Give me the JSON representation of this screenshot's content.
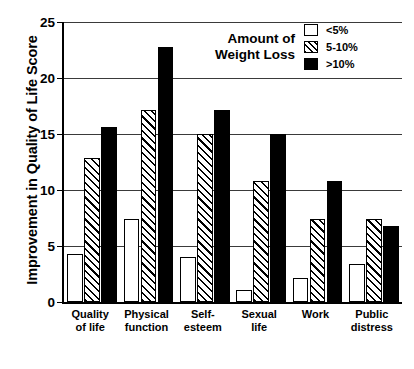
{
  "chart_data": {
    "type": "bar",
    "title": "",
    "subtitle": "",
    "xlabel": "",
    "ylabel": "Improvement in Quality of Life Score",
    "ylim": [
      0,
      25
    ],
    "yticks": [
      0,
      5,
      10,
      15,
      20,
      25
    ],
    "grid": true,
    "legend_position": "top-right",
    "legend_title": "Amount of\nWeight Loss",
    "categories": [
      "Quality\nof life",
      "Physical\nfunction",
      "Self-\nesteem",
      "Sexual\nlife",
      "Work",
      "Public\ndistress"
    ],
    "series": [
      {
        "name": "<5%",
        "fill": "white",
        "values": [
          4.3,
          7.4,
          4.0,
          1.1,
          2.1,
          3.4
        ]
      },
      {
        "name": "5-10%",
        "fill": "hatched",
        "values": [
          12.9,
          17.1,
          15.0,
          10.8,
          7.4,
          7.4
        ]
      },
      {
        "name": ">10%",
        "fill": "black",
        "values": [
          15.6,
          22.8,
          17.1,
          15.0,
          10.8,
          6.8
        ]
      }
    ],
    "colors": {
      "axis": "#000000",
      "grid": "#3a3a3a",
      "series_white": "#ffffff",
      "series_black": "#000000",
      "background": "#ffffff"
    }
  }
}
